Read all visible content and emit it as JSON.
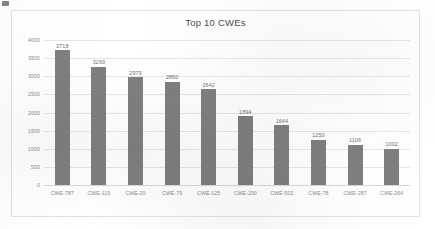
{
  "chart_data": {
    "type": "bar",
    "title": "Top 10 CWEs",
    "xlabel": "",
    "ylabel": "",
    "categories": [
      "CWE-787",
      "CWE-119",
      "CWE-20",
      "CWE-79",
      "CWE-125",
      "CWE-200",
      "CWE-502",
      "CWE-78",
      "CWE-287",
      "CWE-264"
    ],
    "values": [
      3718,
      3269,
      2979,
      2850,
      2642,
      1894,
      1644,
      1250,
      1106,
      1002
    ],
    "data_labels": [
      "3718",
      "3269",
      "2979",
      "2850",
      "2642",
      "1894",
      "1644",
      "1250",
      "1106",
      "1002"
    ],
    "ylim": [
      0,
      4000
    ],
    "ytick_values": [
      0,
      500,
      1000,
      1500,
      2000,
      2500,
      3000,
      3500,
      4000
    ],
    "ytick_labels": [
      "0",
      "500",
      "1000",
      "1500",
      "2000",
      "2500",
      "3000",
      "3500",
      "4000"
    ],
    "grid": true,
    "legend": false,
    "series": [
      {
        "name": "Top 10 CWEs",
        "values": [
          3718,
          3269,
          2979,
          2850,
          2642,
          1894,
          1644,
          1250,
          1106,
          1002
        ]
      }
    ],
    "colors": {
      "bar": "#7f7f7f",
      "gridline": "#e6e6e6",
      "axis_text": "#8a8a8a",
      "title_text": "#4c4c4c",
      "label_text": "#6f6f6f",
      "frame": "#e2e2e2",
      "background": "#ffffff"
    }
  }
}
